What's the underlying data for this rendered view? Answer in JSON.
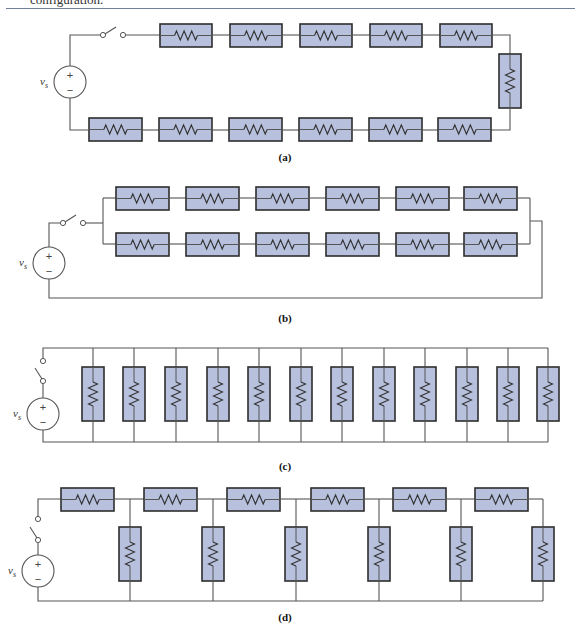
{
  "header": {
    "caption_fragment": "configuration."
  },
  "colors": {
    "resistor_fill": "#b7c1dd",
    "resistor_border": "#2d2d2d",
    "wire": "#555555",
    "rule": "#6f7f98"
  },
  "source_label": "v_s",
  "source_label_main": "v",
  "source_label_sub": "s",
  "plus_sign": "+",
  "minus_sign": "−",
  "diagrams": [
    {
      "id": "a",
      "label": "(a)",
      "topology": "series",
      "resistor_count": 12,
      "switch": "open",
      "description": "12 resistors in series loop: 5 on top, 1 vertical on right, 6 on bottom"
    },
    {
      "id": "b",
      "label": "(b)",
      "topology": "two parallel series strings",
      "resistor_count": 12,
      "switch": "open",
      "description": "2 parallel branches of 6 series resistors each"
    },
    {
      "id": "c",
      "label": "(c)",
      "topology": "parallel",
      "resistor_count": 12,
      "switch": "open",
      "description": "12 resistors in parallel"
    },
    {
      "id": "d",
      "label": "(d)",
      "topology": "ladder",
      "resistor_count": 12,
      "switch": "open",
      "description": "ladder network: 6 series resistors on top, 6 shunt resistors to bottom rail"
    }
  ]
}
